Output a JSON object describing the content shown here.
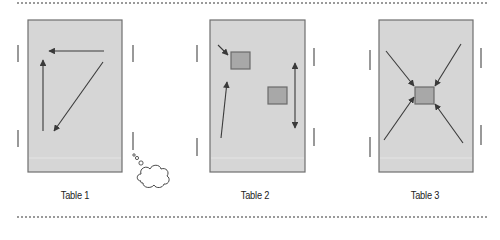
{
  "diagram": {
    "colors": {
      "table_fill": "#d6d6d6",
      "table_border": "#6e6e6e",
      "object_fill": "#a8a8a8",
      "object_border": "#6a6a6a",
      "arrow": "#3a3a3a",
      "side_bar": "#555555",
      "dotted_rule": "#9a9a9a"
    },
    "panels": [
      {
        "label": "Table 1",
        "label_pos": [
          25,
          189
        ],
        "box": [
          28,
          20,
          94,
          152
        ],
        "side_bars": [
          [
            18,
            45,
            18,
            62
          ],
          [
            133,
            45,
            133,
            62
          ],
          [
            18,
            130,
            18,
            147
          ],
          [
            133,
            132,
            133,
            150
          ]
        ],
        "objects": [],
        "arrows": [
          {
            "from": [
              104,
              51
            ],
            "to": [
              49,
              51
            ],
            "heads": "end"
          },
          {
            "from": [
              43,
              131
            ],
            "to": [
              43,
              60
            ],
            "heads": "end"
          },
          {
            "from": [
              103,
              62
            ],
            "to": [
              54,
              131
            ],
            "heads": "end"
          }
        ],
        "thought_bubble": {
          "dots": [
            [
              134,
              155,
              1.2
            ],
            [
              137,
              158,
              1.6
            ],
            [
              141,
              163,
              2.1
            ]
          ],
          "cloud_center": [
            153,
            175
          ],
          "cloud_size": [
            30,
            22
          ]
        }
      },
      {
        "label": "Table 2",
        "label_pos": [
          205,
          189
        ],
        "box": [
          210,
          20,
          95,
          152
        ],
        "side_bars": [
          [
            197,
            45,
            197,
            62
          ],
          [
            314,
            48,
            314,
            66
          ],
          [
            197,
            138,
            197,
            156
          ],
          [
            314,
            128,
            314,
            146
          ]
        ],
        "objects": [
          [
            231,
            52,
            19,
            17
          ],
          [
            268,
            87,
            19,
            17
          ]
        ],
        "arrows": [
          {
            "from": [
              218,
              45
            ],
            "to": [
              228,
              55
            ],
            "heads": "end"
          },
          {
            "from": [
              221,
              138
            ],
            "to": [
              227,
              82
            ],
            "heads": "end"
          },
          {
            "from": [
              295,
              63
            ],
            "to": [
              295,
              128
            ],
            "heads": "both"
          }
        ]
      },
      {
        "label": "Table 3",
        "label_pos": [
          375,
          189
        ],
        "box": [
          379,
          20,
          94,
          152
        ],
        "side_bars": [
          [
            370,
            50,
            370,
            70
          ],
          [
            481,
            48,
            481,
            68
          ],
          [
            370,
            137,
            370,
            157
          ],
          [
            481,
            125,
            481,
            145
          ]
        ],
        "objects": [
          [
            415,
            87,
            19,
            17
          ]
        ],
        "arrows": [
          {
            "from": [
              386,
              51
            ],
            "to": [
              414,
              86
            ],
            "heads": "end"
          },
          {
            "from": [
              461,
              44
            ],
            "to": [
              435,
              86
            ],
            "heads": "end"
          },
          {
            "from": [
              384,
              140
            ],
            "to": [
              414,
              97
            ],
            "heads": "end"
          },
          {
            "from": [
              463,
              143
            ],
            "to": [
              435,
              104
            ],
            "heads": "end"
          }
        ]
      }
    ]
  }
}
